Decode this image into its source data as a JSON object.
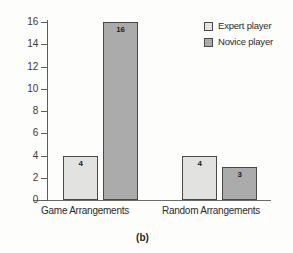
{
  "chart_data": {
    "type": "bar",
    "title": "",
    "subtitle": "",
    "xlabel": "",
    "ylabel": "",
    "categories": [
      "Game Arrangements",
      "Random Arrangements"
    ],
    "series": [
      {
        "name": "Expert player",
        "values": [
          4,
          4
        ],
        "color": "#e2e2e0"
      },
      {
        "name": "Novice player",
        "values": [
          16,
          3
        ],
        "color": "#ababab"
      }
    ],
    "data_labels": [
      "4",
      "16",
      "4",
      "3"
    ],
    "ylim": [
      0,
      16
    ],
    "ytick_values": [
      0,
      2,
      4,
      6,
      8,
      10,
      12,
      14,
      16
    ],
    "ytick_labels": [
      "0",
      "2",
      "4",
      "6",
      "8",
      "10",
      "12",
      "14",
      "16"
    ],
    "grid": false,
    "legend_position": "top-right",
    "legend_entries": [
      "Expert player",
      "Novice player"
    ],
    "annotations": []
  },
  "legend": {
    "entries": [
      {
        "label": "Expert player",
        "swatch": "expert"
      },
      {
        "label": "Novice player",
        "swatch": "novice"
      }
    ]
  },
  "axis": {
    "ticks": [
      {
        "label": "16",
        "value": 16
      },
      {
        "label": "14",
        "value": 14
      },
      {
        "label": "12",
        "value": 12
      },
      {
        "label": "10",
        "value": 10
      },
      {
        "label": "8",
        "value": 8
      },
      {
        "label": "6",
        "value": 6
      },
      {
        "label": "4",
        "value": 4
      },
      {
        "label": "2",
        "value": 2
      },
      {
        "label": "0",
        "value": 0
      }
    ]
  },
  "categories": [
    {
      "label": "Game Arrangements"
    },
    {
      "label": "Random Arrangements"
    }
  ],
  "bars": [
    {
      "value": 4,
      "label": "4",
      "series": "Expert player",
      "category": "Game Arrangements",
      "kind": "expert"
    },
    {
      "value": 16,
      "label": "16",
      "series": "Novice player",
      "category": "Game Arrangements",
      "kind": "novice"
    },
    {
      "value": 4,
      "label": "4",
      "series": "Expert player",
      "category": "Random Arrangements",
      "kind": "expert"
    },
    {
      "value": 3,
      "label": "3",
      "series": "Novice player",
      "category": "Random Arrangements",
      "kind": "novice"
    }
  ],
  "caption": {
    "text": "(b)"
  },
  "colors": {
    "expert": "#e2e2e0",
    "novice": "#ababab",
    "axis": "#5d5d5d",
    "ink": "#2b2b2b",
    "background": "#fdfdfb"
  }
}
